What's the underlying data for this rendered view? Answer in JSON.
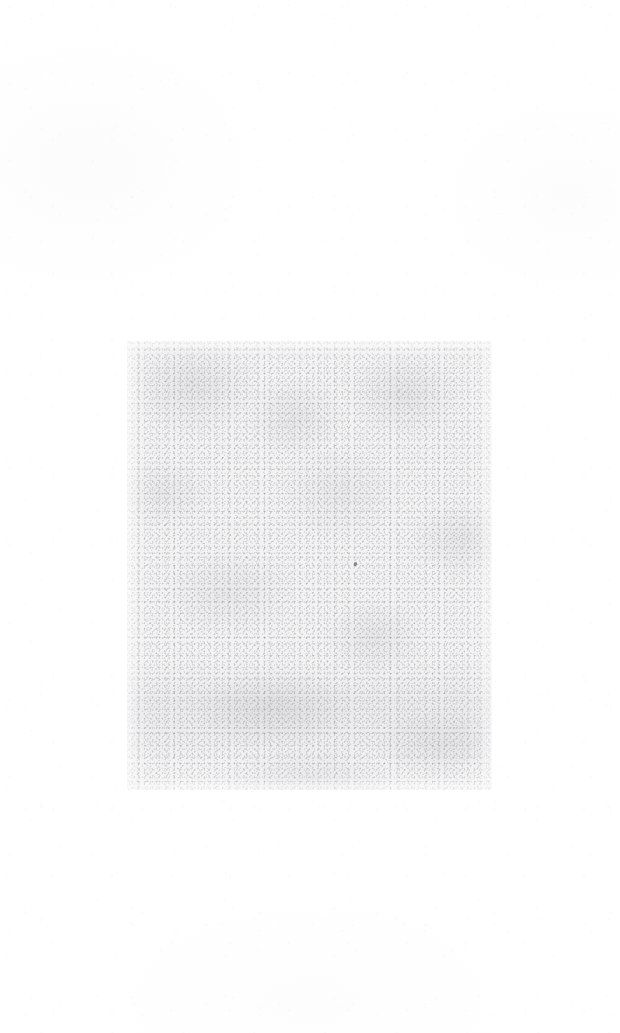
{
  "page": {
    "kind": "scanned-page",
    "background_color": "#ffffff",
    "width": 620,
    "height": 1033,
    "visible_text": "",
    "description_label": ""
  },
  "scan_region": {
    "label": "",
    "fill_color": "#f2f2f3",
    "speckle_color": "#767680",
    "left": 127,
    "top": 341,
    "width": 365,
    "height": 449
  },
  "artifacts": {
    "dust_speck_label": ""
  }
}
